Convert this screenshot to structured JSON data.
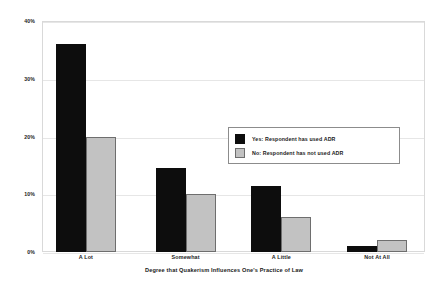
{
  "chart_data": {
    "type": "bar",
    "title": "",
    "xlabel": "Degree that Quakerism Influences One's Practice of Law",
    "ylabel": "",
    "categories": [
      "A Lot",
      "Somewhat",
      "A Little",
      "Not At All"
    ],
    "series": [
      {
        "name": "Yes: Respondent has used ADR",
        "color": "#0d0d0d",
        "values": [
          36,
          14.5,
          11.5,
          1
        ]
      },
      {
        "name": "No: Respondent has not used ADR",
        "color": "#c2c2c2",
        "values": [
          20,
          10,
          6,
          2
        ]
      }
    ],
    "ylim": [
      0,
      40
    ],
    "yticks": [
      0,
      10,
      20,
      30,
      40
    ],
    "ytick_labels": [
      "0%",
      "10%",
      "20%",
      "30%",
      "40%"
    ],
    "grid": true,
    "legend_position": "center-right"
  },
  "legend": {
    "entries": [
      {
        "label": "Yes: Respondent has used ADR"
      },
      {
        "label": "No: Respondent has not used ADR"
      }
    ]
  }
}
